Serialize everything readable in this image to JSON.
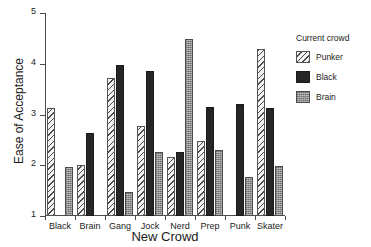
{
  "chart_data": {
    "type": "bar",
    "title": "Middle School Students",
    "xlabel": "New Crowd",
    "ylabel": "Ease of Acceptance",
    "legend_title": "Current crowd",
    "legend_position": "right",
    "grid": false,
    "ylim": [
      1,
      5
    ],
    "yticks": [
      "1",
      "2",
      "3",
      "4",
      "5"
    ],
    "categories": [
      "Black",
      "Brain",
      "Gang",
      "Jock",
      "Nerd",
      "Prep",
      "Punk",
      "Skater"
    ],
    "series": [
      {
        "name": "Punker",
        "fill": "diagonal-hatch",
        "color": "#f2f2f2",
        "values": [
          3.12,
          2.0,
          3.72,
          2.78,
          2.17,
          2.48,
          null,
          4.29
        ]
      },
      {
        "name": "Black",
        "fill": "solid-dark",
        "color": "#262626",
        "values": [
          null,
          2.63,
          3.98,
          3.85,
          2.26,
          3.14,
          3.2,
          3.12
        ]
      },
      {
        "name": "Brain",
        "fill": "gray-stipple",
        "color": "#8c8c8c",
        "values": [
          1.97,
          null,
          1.48,
          2.26,
          4.48,
          2.3,
          1.77,
          1.98
        ]
      }
    ]
  }
}
